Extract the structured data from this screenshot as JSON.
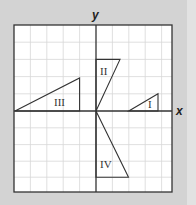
{
  "axes": {
    "x_label": "x",
    "y_label": "y"
  },
  "grid": {
    "cell_size_px": 16.5,
    "x_cells_left": 5,
    "x_cells_right": 4.7,
    "y_cells_up": 5,
    "y_cells_down": 5
  },
  "triangles": [
    {
      "label": "I",
      "quadrant": "first",
      "vertices_grid": [
        [
          2,
          0
        ],
        [
          4,
          0
        ],
        [
          4,
          1
        ]
      ]
    },
    {
      "label": "II",
      "quadrant": "first",
      "vertices_grid": [
        [
          0,
          0
        ],
        [
          0,
          3
        ],
        [
          1.5,
          3
        ]
      ]
    },
    {
      "label": "III",
      "quadrant": "second",
      "vertices_grid": [
        [
          -5,
          0
        ],
        [
          -1,
          0
        ],
        [
          -1,
          2
        ]
      ]
    },
    {
      "label": "IV",
      "quadrant": "fourth",
      "vertices_grid": [
        [
          0,
          0
        ],
        [
          2,
          -4
        ],
        [
          0,
          -4
        ]
      ]
    }
  ],
  "colors": {
    "background": "#d3d3d3",
    "grid_fill": "#ffffff",
    "grid_lines": "#d8d8d8",
    "axes": "#333333",
    "border": "#333333"
  }
}
